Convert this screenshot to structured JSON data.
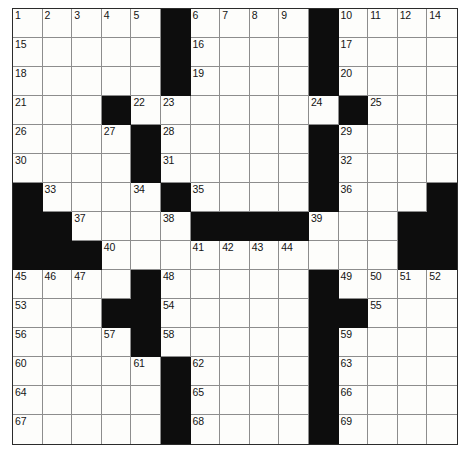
{
  "puzzle": {
    "type": "crossword-grid",
    "rows": 15,
    "columns": 15,
    "colors": {
      "block": "#0d0d0d",
      "open": "#fdfdfb",
      "gridline": "#8d8d8d",
      "border": "#2b2b2b",
      "number": "#141414",
      "page_background": "#ffffff"
    },
    "highest_clue_number": 69,
    "grid": [
      [
        "o",
        "o",
        "o",
        "o",
        "o",
        "x",
        "o",
        "o",
        "o",
        "o",
        "x",
        "o",
        "o",
        "o",
        "o"
      ],
      [
        "o",
        "o",
        "o",
        "o",
        "o",
        "x",
        "o",
        "o",
        "o",
        "o",
        "x",
        "o",
        "o",
        "o",
        "o"
      ],
      [
        "o",
        "o",
        "o",
        "o",
        "o",
        "x",
        "o",
        "o",
        "o",
        "o",
        "x",
        "o",
        "o",
        "o",
        "o"
      ],
      [
        "o",
        "o",
        "o",
        "x",
        "o",
        "o",
        "o",
        "o",
        "o",
        "o",
        "o",
        "x",
        "o",
        "o",
        "o"
      ],
      [
        "o",
        "o",
        "o",
        "o",
        "x",
        "o",
        "o",
        "o",
        "o",
        "o",
        "x",
        "o",
        "o",
        "o",
        "o"
      ],
      [
        "o",
        "o",
        "o",
        "o",
        "x",
        "o",
        "o",
        "o",
        "o",
        "o",
        "x",
        "o",
        "o",
        "o",
        "o"
      ],
      [
        "x",
        "o",
        "o",
        "o",
        "o",
        "x",
        "o",
        "o",
        "o",
        "o",
        "x",
        "o",
        "o",
        "o",
        "x"
      ],
      [
        "x",
        "x",
        "o",
        "o",
        "o",
        "o",
        "x",
        "x",
        "x",
        "x",
        "o",
        "o",
        "o",
        "x",
        "x"
      ],
      [
        "x",
        "x",
        "x",
        "o",
        "o",
        "o",
        "o",
        "o",
        "o",
        "o",
        "o",
        "o",
        "o",
        "x",
        "x"
      ],
      [
        "o",
        "o",
        "o",
        "o",
        "x",
        "o",
        "o",
        "o",
        "o",
        "o",
        "x",
        "o",
        "o",
        "o",
        "o"
      ],
      [
        "o",
        "o",
        "o",
        "x",
        "x",
        "o",
        "o",
        "o",
        "o",
        "o",
        "x",
        "x",
        "o",
        "o",
        "o"
      ],
      [
        "o",
        "o",
        "o",
        "o",
        "x",
        "o",
        "o",
        "o",
        "o",
        "o",
        "x",
        "o",
        "o",
        "o",
        "o"
      ],
      [
        "o",
        "o",
        "o",
        "o",
        "o",
        "x",
        "o",
        "o",
        "o",
        "o",
        "x",
        "o",
        "o",
        "o",
        "o"
      ],
      [
        "o",
        "o",
        "o",
        "o",
        "o",
        "x",
        "o",
        "o",
        "o",
        "o",
        "x",
        "o",
        "o",
        "o",
        "o"
      ],
      [
        "o",
        "o",
        "o",
        "o",
        "o",
        "x",
        "o",
        "o",
        "o",
        "o",
        "x",
        "o",
        "o",
        "o",
        "o"
      ]
    ],
    "numbers": [
      [
        1,
        2,
        3,
        4,
        5,
        null,
        6,
        7,
        8,
        9,
        null,
        10,
        11,
        12,
        13
      ],
      [
        14,
        null,
        null,
        null,
        null,
        null,
        null,
        null,
        null,
        null,
        null,
        null,
        null,
        null,
        null
      ]
    ],
    "number_map": {
      "0-0": "1",
      "0-1": "2",
      "0-2": "3",
      "0-3": "4",
      "0-4": "5",
      "0-6": "6",
      "0-7": "7",
      "0-8": "8",
      "0-9": "9",
      "0-11": "10",
      "0-12": "11",
      "0-13": "12",
      "0-14": "13",
      "1-0": "15",
      "1-6": "16",
      "1-11": "17",
      "2-0": "18",
      "2-6": "19",
      "2-11": "20",
      "3-0": "21",
      "3-4": "22",
      "3-5": "23",
      "3-10": "24",
      "3-12": "25",
      "4-0": "26",
      "4-3": "27",
      "4-5": "28",
      "4-11": "29",
      "5-0": "30",
      "5-5": "31",
      "5-11": "32",
      "6-1": "33",
      "6-4": "34",
      "6-6": "35",
      "6-11": "36",
      "7-2": "37",
      "7-5": "38",
      "7-10": "39",
      "8-3": "40",
      "8-6": "41",
      "8-7": "42",
      "8-8": "43",
      "8-9": "44",
      "9-0": "45",
      "9-1": "46",
      "9-2": "47",
      "9-5": "48",
      "9-11": "49",
      "9-12": "50",
      "9-13": "51",
      "9-14": "52",
      "10-0": "53",
      "10-5": "54",
      "10-12": "55",
      "11-0": "56",
      "11-3": "57",
      "11-5": "58",
      "11-11": "59",
      "12-0": "60",
      "12-4": "61",
      "12-6": "62",
      "12-11": "63",
      "13-0": "64",
      "13-6": "65",
      "13-11": "66",
      "14-0": "67",
      "14-6": "68",
      "14-11": "69"
    },
    "extra_numbers_note": {
      "0-14": "14"
    },
    "letters": {}
  }
}
